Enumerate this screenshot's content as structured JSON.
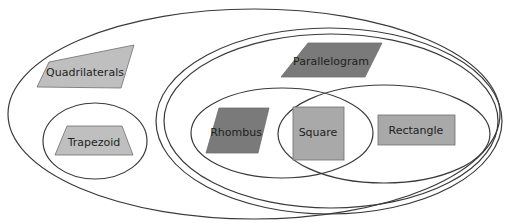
{
  "diagram": {
    "type": "nested-venn",
    "colors": {
      "outline": "#3a3a3a",
      "light_fill": "#bfbfbf",
      "medium_fill": "#a9a9a9",
      "dark_fill": "#7a7a7a"
    },
    "sets": [
      {
        "id": "quadrilaterals",
        "label": "Quadrilaterals",
        "contains": [
          "trapezoid",
          "parallelogram"
        ]
      },
      {
        "id": "trapezoid",
        "label": "Trapezoid"
      },
      {
        "id": "parallelogram",
        "label": "Parallelogram",
        "contains": [
          "rhombus",
          "rectangle"
        ]
      },
      {
        "id": "rhombus",
        "label": "Rhombus"
      },
      {
        "id": "rectangle",
        "label": "Rectangle"
      },
      {
        "id": "square",
        "label": "Square",
        "intersection_of": [
          "rhombus",
          "rectangle"
        ]
      }
    ],
    "labels": {
      "quadrilaterals": "Quadrilaterals",
      "trapezoid": "Trapezoid",
      "parallelogram": "Parallelogram",
      "rhombus": "Rhombus",
      "square": "Square",
      "rectangle": "Rectangle"
    }
  }
}
